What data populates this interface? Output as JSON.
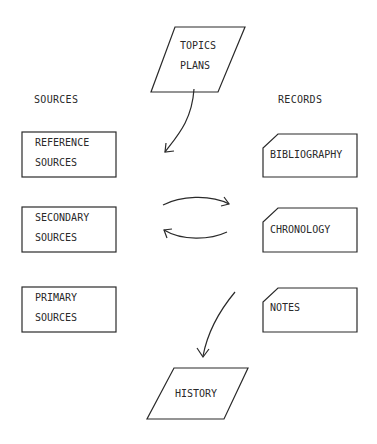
{
  "diagram": {
    "headers": {
      "sources": "SOURCES",
      "records": "RECORDS"
    },
    "topics": {
      "line1": "TOPICS",
      "line2": "PLANS"
    },
    "sources": [
      {
        "line1": "REFERENCE",
        "line2": "SOURCES"
      },
      {
        "line1": "SECONDARY",
        "line2": "SOURCES"
      },
      {
        "line1": "PRIMARY",
        "line2": "SOURCES"
      }
    ],
    "records": [
      {
        "label": "BIBLIOGRAPHY"
      },
      {
        "label": "CHRONOLOGY"
      },
      {
        "label": "NOTES"
      }
    ],
    "output": {
      "label": "HISTORY"
    },
    "colors": {
      "stroke": "#2a2a2a",
      "background": "#ffffff"
    }
  }
}
